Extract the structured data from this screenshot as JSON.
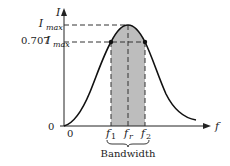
{
  "diagram": {
    "y_axis": {
      "label": "I"
    },
    "x_axis": {
      "label": "f"
    },
    "y_ticks": {
      "zero": "0",
      "imax": {
        "main": "I",
        "sub": "max"
      },
      "half_power": {
        "prefix": "0.707",
        "main": "I",
        "sub": "max"
      }
    },
    "x_ticks": {
      "origin": "0",
      "f1": {
        "main": "f",
        "sub": "1"
      },
      "fr": {
        "main": "f",
        "sub": "r"
      },
      "f2": {
        "main": "f",
        "sub": "2"
      }
    },
    "bandwidth_label": "Bandwidth",
    "colors": {
      "curve": "#111111",
      "shaded_band": "#bdbdbd",
      "dashed": "#333333"
    }
  }
}
